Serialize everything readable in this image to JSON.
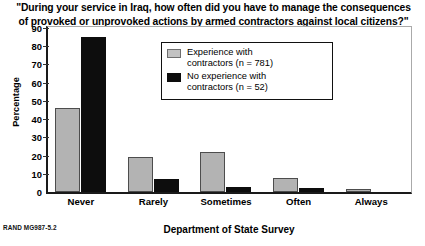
{
  "figure": {
    "title_line1": "\"During your service in Iraq, how often did you have to manage the consequences",
    "title_line2": "of provoked or unprovoked actions by armed contractors against local citizens?\"",
    "source_note": "RAND MG987-5.2"
  },
  "legend": {
    "entries": [
      {
        "label": "Experience with\ncontractors (n = 781)",
        "color": "#b3b3b3",
        "swatch": "gray"
      },
      {
        "label": "No experience with\ncontractors (n = 52)",
        "color": "#0d0d0d",
        "swatch": "black"
      }
    ]
  },
  "chart_data": {
    "type": "bar",
    "title": "\"During your service in Iraq, how often did you have to manage the consequences of provoked or unprovoked actions by armed contractors against local citizens?\"",
    "xlabel": "Department of State Survey",
    "ylabel": "Percentage",
    "categories": [
      "Never",
      "Rarely",
      "Sometimes",
      "Often",
      "Always"
    ],
    "series": [
      {
        "name": "Experience with contractors (n = 781)",
        "color": "#b3b3b3",
        "values": [
          46,
          19,
          22,
          7.5,
          1.5
        ]
      },
      {
        "name": "No experience with contractors (n = 52)",
        "color": "#0d0d0d",
        "values": [
          85,
          7,
          3,
          2,
          0
        ]
      }
    ],
    "ylim": [
      0,
      90
    ],
    "yticks": [
      0,
      10,
      20,
      30,
      40,
      50,
      60,
      70,
      80,
      90
    ],
    "ytick_labels": [
      "0",
      "10",
      "20",
      "30",
      "40",
      "50",
      "60",
      "70",
      "80",
      "90"
    ],
    "grid": false,
    "legend_position": "upper center"
  }
}
